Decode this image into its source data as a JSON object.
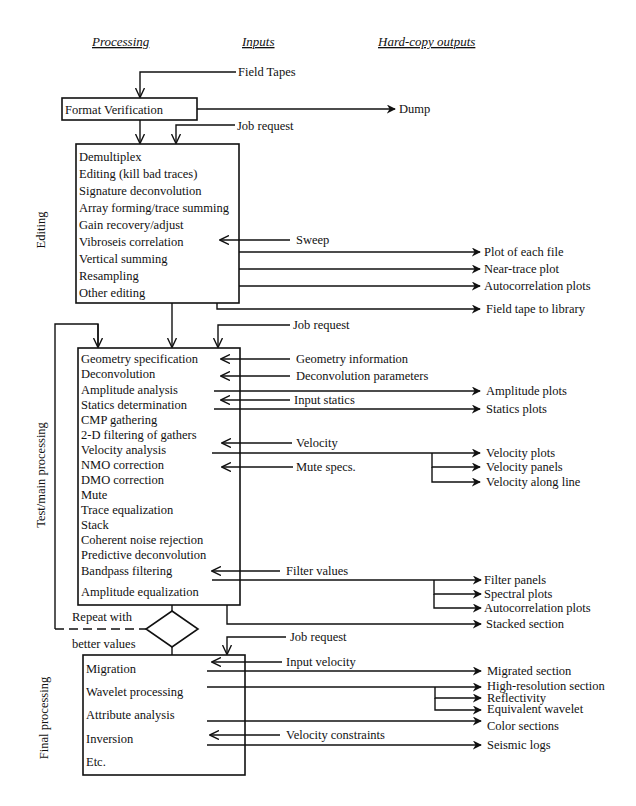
{
  "headers": {
    "processing": "Processing",
    "inputs": "Inputs",
    "outputs": "Hard-copy outputs"
  },
  "side_labels": {
    "editing": "Editing",
    "test_main": "Test/main processing",
    "final": "Final processing"
  },
  "format_verification": {
    "label": "Format Verification",
    "input": "Field Tapes",
    "output": "Dump",
    "job_request": "Job request"
  },
  "editing": {
    "items": [
      "Demultiplex",
      "Editing (kill bad traces)",
      "Signature deconvolution",
      "Array forming/trace summing",
      "Gain recovery/adjust",
      "Vibroseis correlation",
      "Vertical summing",
      "Resampling",
      "Other editing"
    ],
    "inputs": [
      "Sweep"
    ],
    "outputs": [
      "Plot of each file",
      "Near-trace plot",
      "Autocorrelation plots",
      "Field tape to library"
    ]
  },
  "test_main": {
    "job_request": "Job request",
    "items": [
      "Geometry specification",
      "Deconvolution",
      "Amplitude analysis",
      "Statics determination",
      "CMP gathering",
      "2-D filtering of gathers",
      "Velocity analysis",
      "NMO correction",
      "DMO correction",
      "Mute",
      "Trace equalization",
      "Stack",
      "Coherent noise rejection",
      "Predictive deconvolution",
      "Bandpass filtering",
      "Amplitude equalization"
    ],
    "inputs": [
      "Geometry information",
      "Deconvolution parameters",
      "Input statics",
      "Velocity",
      "Mute specs.",
      "Filter values"
    ],
    "outputs": [
      "Amplitude plots",
      "Statics plots",
      "Velocity plots",
      "Velocity panels",
      "Velocity along line",
      "Filter panels",
      "Spectral plots",
      "Autocorrelation plots",
      "Stacked section"
    ]
  },
  "decision": {
    "label_top": "Repeat with",
    "label_bottom": "better values"
  },
  "final": {
    "job_request": "Job request",
    "items": [
      "Migration",
      "Wavelet processing",
      "Attribute analysis",
      "Inversion",
      "Etc."
    ],
    "inputs": [
      "Input velocity",
      "Velocity constraints"
    ],
    "outputs": [
      "Migrated section",
      "High-resolution section",
      "Reflectivity",
      "Equivalent wavelet",
      "Color sections",
      "Seismic logs"
    ]
  }
}
